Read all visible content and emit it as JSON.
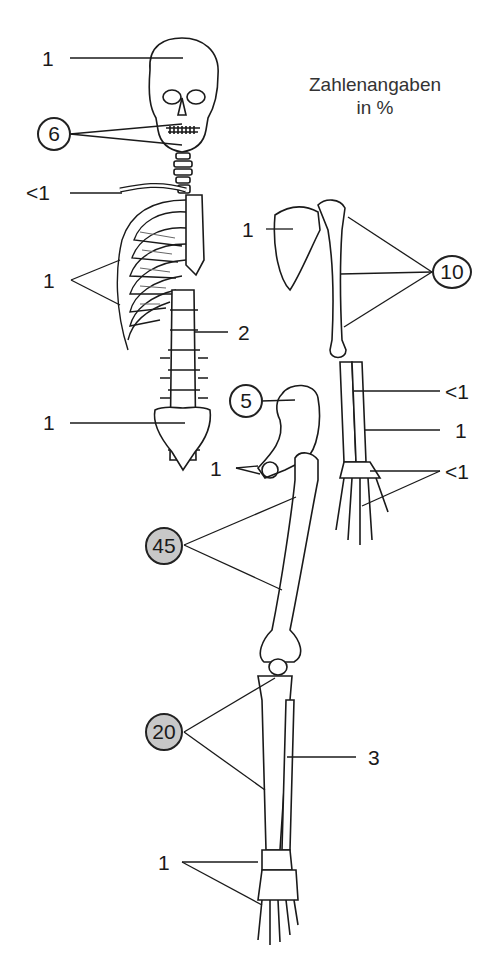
{
  "legend": {
    "line1": "Zahlenangaben",
    "line2": "in %"
  },
  "labels": {
    "skull": "1",
    "jaw_teeth": "6",
    "clavicle": "<1",
    "ribs": "1",
    "spine": "2",
    "sacrum": "1",
    "scapula": "1",
    "humerus": "10",
    "radius": "<1",
    "ulna": "1",
    "hand": "<1",
    "pelvis_ilium": "5",
    "pelvis_pubis": "1",
    "femur": "45",
    "tibia": "20",
    "fibula": "3",
    "foot": "1"
  },
  "colors": {
    "line": "#1a1a1a",
    "highlight_circle": "#c8c8c8",
    "circle": "#ffffff"
  }
}
